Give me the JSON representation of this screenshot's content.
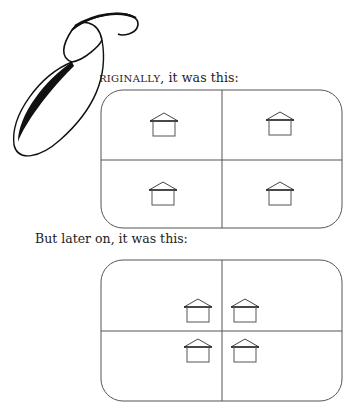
{
  "drop_cap": "O",
  "paragraph1": {
    "smallcaps": "RIGINALLY",
    "rest": ", it was this:"
  },
  "paragraph2": "But later on, it was this:",
  "diagrams": [
    {
      "name": "original",
      "houses": [
        {
          "quadrant": "top-left"
        },
        {
          "quadrant": "top-right"
        },
        {
          "quadrant": "bottom-left"
        },
        {
          "quadrant": "bottom-right"
        }
      ]
    },
    {
      "name": "later",
      "houses": [
        {
          "quadrant": "top-left",
          "position": "near-center"
        },
        {
          "quadrant": "top-right",
          "position": "near-center"
        },
        {
          "quadrant": "bottom-left",
          "position": "near-center"
        },
        {
          "quadrant": "bottom-right",
          "position": "near-center"
        }
      ]
    }
  ],
  "colors": {
    "ink": "#222222",
    "line": "#555555"
  }
}
